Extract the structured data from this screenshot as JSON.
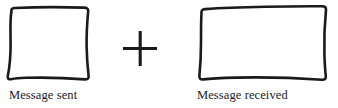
{
  "figure": {
    "width": 338,
    "height": 108,
    "background_color": "#ffffff",
    "stroke_color": "#1a1a1a",
    "text_color": "#1a1a1a"
  },
  "left_item": {
    "caption": "Message sent",
    "shape_name": "hand-drawn-square",
    "box": {
      "x": 9,
      "y": 8,
      "width": 80,
      "height": 71
    }
  },
  "operator": {
    "symbol": "+",
    "name": "plus-sign",
    "center": {
      "x": 140,
      "y": 48
    },
    "arm_length": 34,
    "thickness": 3
  },
  "right_item": {
    "caption": "Message received",
    "shape_name": "hand-drawn-rectangle",
    "box": {
      "x": 199,
      "y": 7,
      "width": 127,
      "height": 73
    }
  }
}
